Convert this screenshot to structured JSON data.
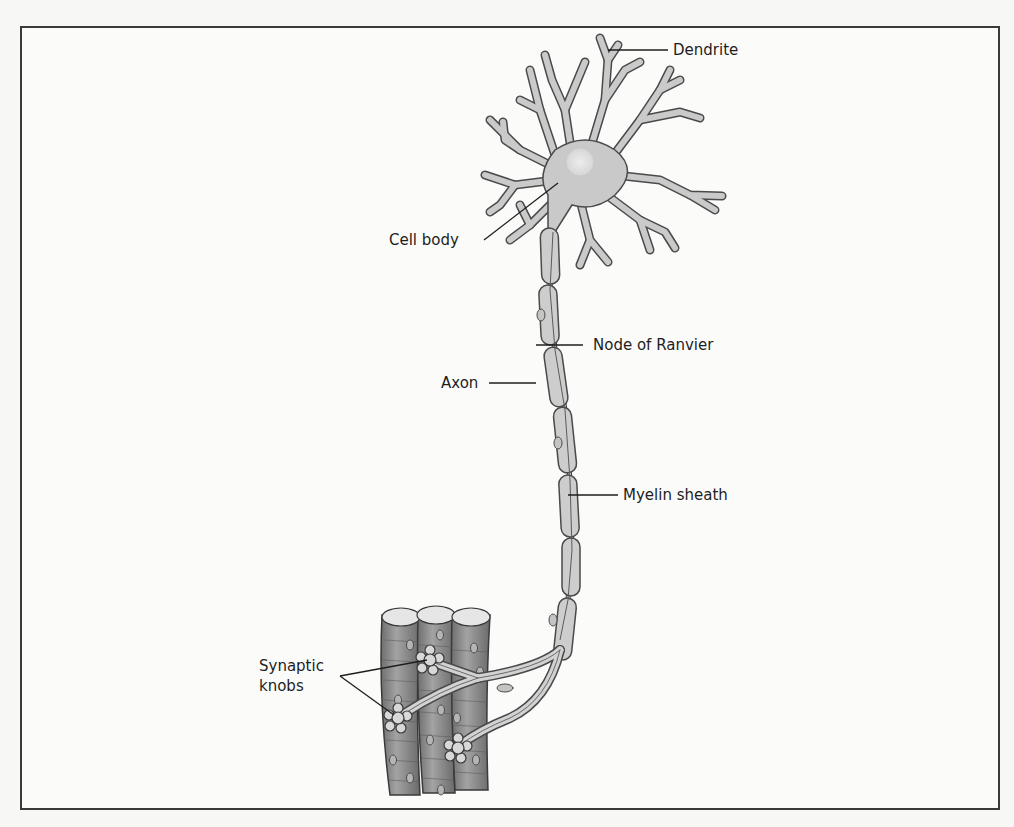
{
  "diagram": {
    "colors": {
      "outline": "#4a4a4a",
      "cell_fill": "#c9c9c9",
      "nucleus_fill": "#e2e2e2",
      "muscle_fill": "#8e8e8e",
      "muscle_top": "#e4e4e4",
      "label_line": "#1e1e1e",
      "frame_border": "#3a3a3a",
      "background": "#fbfbfa"
    },
    "labels": {
      "dendrite": "Dendrite",
      "cell_body": "Cell body",
      "node_of_ranvier": "Node of Ranvier",
      "axon": "Axon",
      "myelin_sheath": "Myelin sheath",
      "synaptic_knobs": "Synaptic\nknobs"
    },
    "parts": [
      "dendrites",
      "cell body with nucleus",
      "axon",
      "myelin sheath segments",
      "nodes of Ranvier",
      "axon terminal branches",
      "synaptic knobs",
      "muscle fibers"
    ]
  }
}
